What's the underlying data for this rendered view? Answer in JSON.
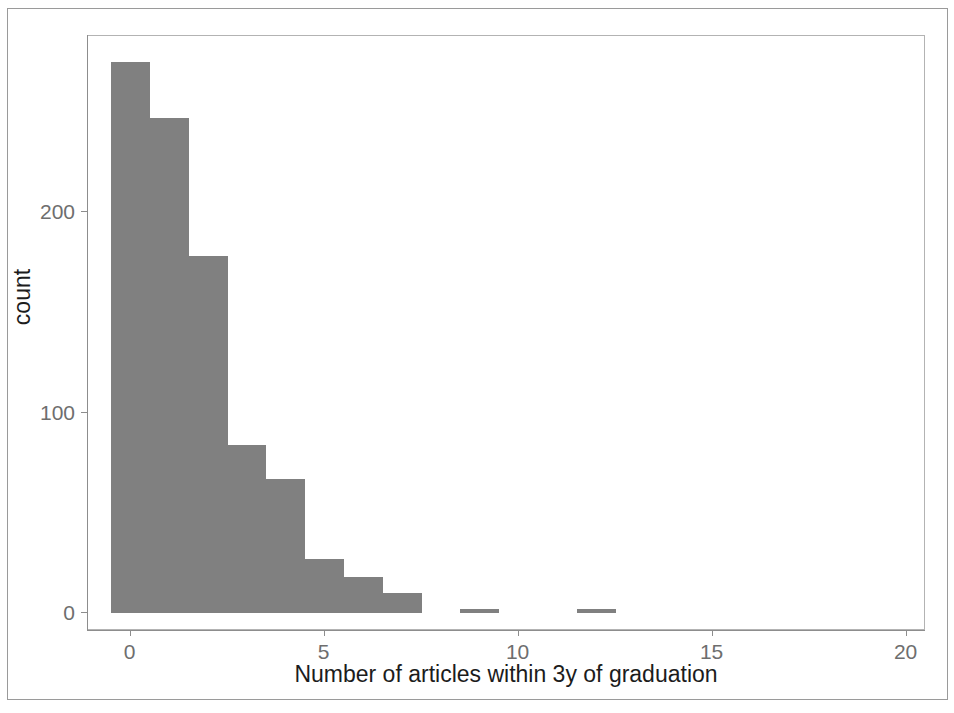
{
  "figure": {
    "width": 954,
    "height": 713,
    "background": "#ffffff",
    "panel": {
      "left": 87,
      "top": 35,
      "width": 838,
      "height": 595,
      "border_color": "#b3b3b3"
    },
    "frame_color": "#9a9a9a"
  },
  "chart_data": {
    "type": "bar",
    "title": "",
    "subtitle": "",
    "xlabel": "Number of articles within 3y of graduation",
    "ylabel": "count",
    "bin_width": 1,
    "xlim": [
      -1.1,
      20.5
    ],
    "ylim": [
      -9,
      288
    ],
    "xticks": [
      0,
      5,
      10,
      15,
      20
    ],
    "xtick_labels": [
      "0",
      "5",
      "10",
      "15",
      "20"
    ],
    "yticks": [
      0,
      100,
      200
    ],
    "ytick_labels": [
      "0",
      "100",
      "200"
    ],
    "grid": false,
    "legend": "none",
    "bar_color": "#808080",
    "categories": [
      0,
      1,
      2,
      3,
      4,
      5,
      6,
      7,
      9,
      12
    ],
    "values": [
      275,
      247,
      178,
      84,
      67,
      27,
      18,
      10,
      2,
      2
    ],
    "bars": [
      {
        "x": 0,
        "value": 275
      },
      {
        "x": 1,
        "value": 247
      },
      {
        "x": 2,
        "value": 178
      },
      {
        "x": 3,
        "value": 84
      },
      {
        "x": 4,
        "value": 67
      },
      {
        "x": 5,
        "value": 27
      },
      {
        "x": 6,
        "value": 18
      },
      {
        "x": 7,
        "value": 10
      },
      {
        "x": 9,
        "value": 2
      },
      {
        "x": 12,
        "value": 2
      }
    ]
  }
}
